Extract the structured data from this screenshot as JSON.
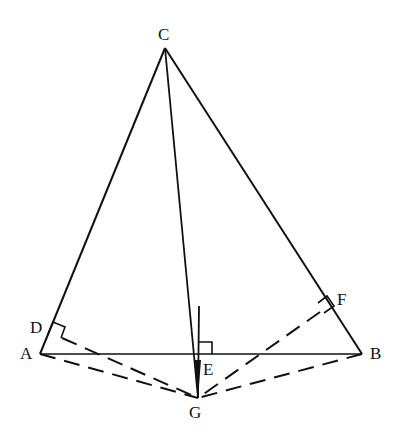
{
  "diagram": {
    "type": "geometry",
    "points": {
      "C": {
        "label": "C",
        "x": 165,
        "y": 48
      },
      "A": {
        "label": "A",
        "x": 40,
        "y": 354
      },
      "B": {
        "label": "B",
        "x": 362,
        "y": 354
      },
      "E": {
        "label": "E",
        "x": 196,
        "y": 354
      },
      "G": {
        "label": "G",
        "x": 198,
        "y": 398
      },
      "D": {
        "label": "D",
        "x": 52,
        "y": 326
      },
      "F": {
        "label": "F",
        "x": 330,
        "y": 304
      }
    },
    "solid_segments": [
      "CA",
      "CB",
      "AB",
      "CG",
      "E-perpendicular"
    ],
    "dashed_segments": [
      "AG",
      "BG",
      "DG",
      "FG"
    ],
    "right_angles": [
      "D",
      "E",
      "F"
    ],
    "colors": {
      "line": "#111111",
      "background": "#ffffff"
    }
  }
}
